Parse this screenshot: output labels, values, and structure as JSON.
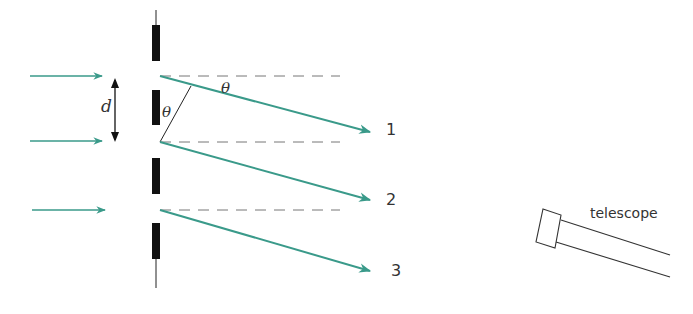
{
  "diagram": {
    "labels": {
      "spacing": "d",
      "angle_top": "θ",
      "angle_inner": "θ",
      "ray1": "1",
      "ray2": "2",
      "ray3": "3",
      "telescope": "telescope"
    },
    "colors": {
      "ray": "#3a9a8a",
      "incident": "#3a9a8a",
      "slit_bar": "#111111",
      "dashed": "#666666",
      "text": "#333333"
    }
  }
}
